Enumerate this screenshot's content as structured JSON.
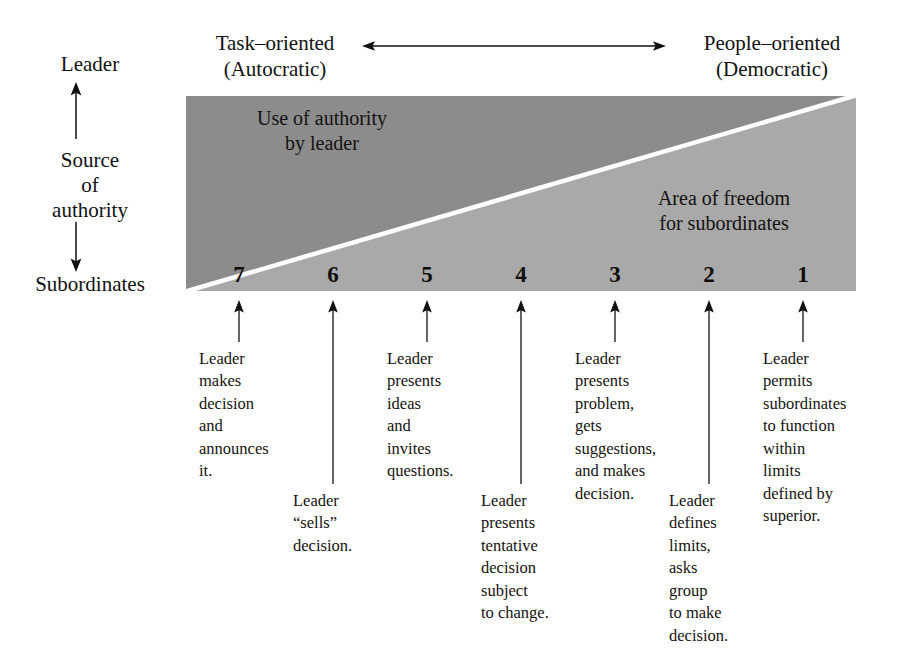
{
  "headers": {
    "left_line1": "Task–oriented",
    "left_line2": "(Autocratic)",
    "right_line1": "People–oriented",
    "right_line2": "(Democratic)",
    "axis_arrow": "double-headed-horizontal-arrow"
  },
  "vertical_axis": {
    "top_label": "Leader",
    "middle_label_line1": "Source",
    "middle_label_line2": "of",
    "middle_label_line3": "authority",
    "bottom_label": "Subordinates",
    "up_arrow": "arrow-up",
    "down_arrow": "arrow-down"
  },
  "regions": {
    "upper_line1": "Use of authority",
    "upper_line2": "by leader",
    "lower_line1": "Area of freedom",
    "lower_line2": "for subordinates",
    "upper_color": "#8c8c8c",
    "lower_color": "#a9a9a9",
    "divider_color": "#ffffff"
  },
  "scale": {
    "numbers": [
      "7",
      "6",
      "5",
      "4",
      "3",
      "2",
      "1"
    ],
    "positions": [
      239,
      333,
      427,
      521,
      615,
      709,
      803
    ]
  },
  "callouts": [
    {
      "number": "7",
      "tier": "upper",
      "x": 199,
      "lines": [
        "Leader",
        "makes",
        "decision",
        "and",
        "announces",
        "it."
      ]
    },
    {
      "number": "6",
      "tier": "lower",
      "x": 293,
      "lines": [
        "Leader",
        "“sells”",
        "decision."
      ]
    },
    {
      "number": "5",
      "tier": "upper",
      "x": 387,
      "lines": [
        "Leader",
        "presents",
        "ideas",
        "and",
        "invites",
        "questions."
      ]
    },
    {
      "number": "4",
      "tier": "lower",
      "x": 481,
      "lines": [
        "Leader",
        "presents",
        "tentative",
        "decision",
        "subject",
        "to change."
      ]
    },
    {
      "number": "3",
      "tier": "upper",
      "x": 575,
      "lines": [
        "Leader",
        "presents",
        "problem,",
        "gets",
        "suggestions,",
        "and makes",
        "decision."
      ]
    },
    {
      "number": "2",
      "tier": "lower",
      "x": 669,
      "lines": [
        "Leader",
        "defines",
        "limits,",
        "asks",
        "group",
        "to make",
        "decision."
      ]
    },
    {
      "number": "1",
      "tier": "upper",
      "x": 763,
      "lines": [
        "Leader",
        "permits",
        "subordinates",
        "to function",
        "within",
        "limits",
        "defined by",
        "superior."
      ]
    }
  ]
}
